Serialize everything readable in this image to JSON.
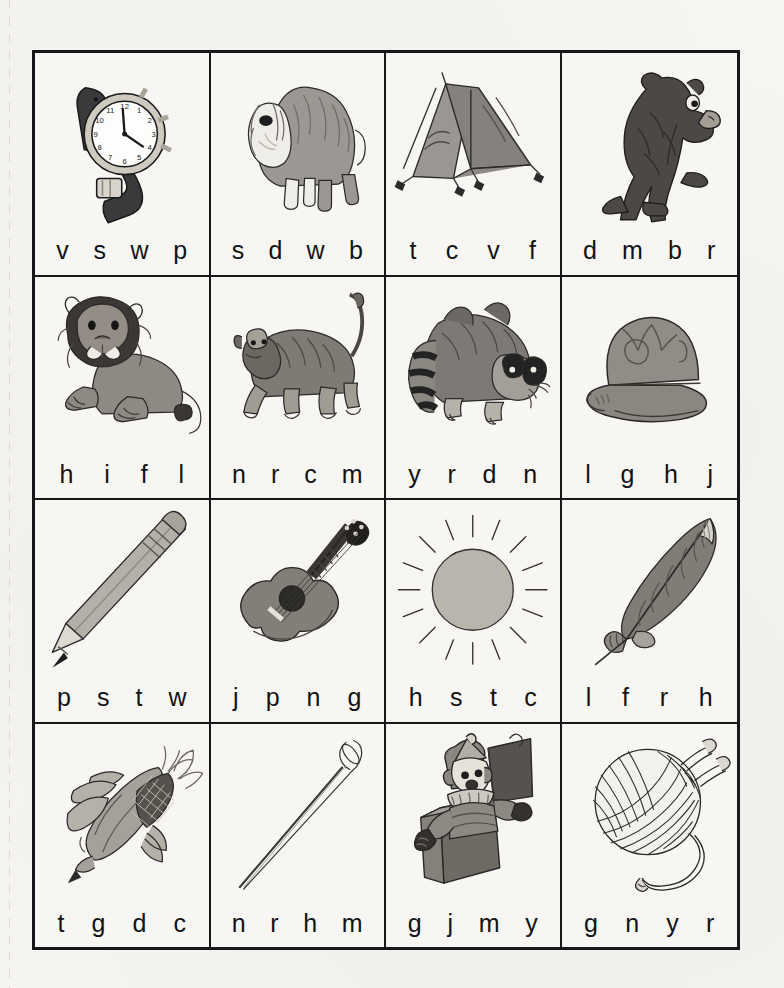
{
  "worksheet": {
    "title": "Beginning Sounds Picture Grid",
    "grid": {
      "rows": 4,
      "columns": 4
    },
    "ink_color": "#16181a",
    "paper_color": "#f7f6f3"
  },
  "cells": [
    {
      "id": "cell-watch",
      "picture": "watch",
      "picture_icon": "wristwatch-icon",
      "letters": [
        "v",
        "s",
        "w",
        "p"
      ],
      "answer": "w"
    },
    {
      "id": "cell-dog",
      "picture": "sheepdog",
      "picture_icon": "dog-icon",
      "letters": [
        "s",
        "d",
        "w",
        "b"
      ],
      "answer": "d"
    },
    {
      "id": "cell-tent",
      "picture": "tent",
      "picture_icon": "tent-icon",
      "letters": [
        "t",
        "c",
        "v",
        "f"
      ],
      "answer": "t"
    },
    {
      "id": "cell-bear",
      "picture": "bear",
      "picture_icon": "bear-icon",
      "letters": [
        "d",
        "m",
        "b",
        "r"
      ],
      "answer": "b"
    },
    {
      "id": "cell-lion",
      "picture": "lion",
      "picture_icon": "lion-icon",
      "letters": [
        "h",
        "i",
        "f",
        "l"
      ],
      "answer": "l"
    },
    {
      "id": "cell-monkey",
      "picture": "monkey",
      "picture_icon": "monkey-icon",
      "letters": [
        "n",
        "r",
        "c",
        "m"
      ],
      "answer": "m"
    },
    {
      "id": "cell-raccoon",
      "picture": "raccoon",
      "picture_icon": "raccoon-icon",
      "letters": [
        "y",
        "r",
        "d",
        "n"
      ],
      "answer": "r"
    },
    {
      "id": "cell-hat",
      "picture": "hat",
      "picture_icon": "hat-icon",
      "letters": [
        "l",
        "g",
        "h",
        "j"
      ],
      "answer": "h"
    },
    {
      "id": "cell-pencil",
      "picture": "pencil",
      "picture_icon": "pencil-icon",
      "letters": [
        "p",
        "s",
        "t",
        "w"
      ],
      "answer": "p"
    },
    {
      "id": "cell-guitar",
      "picture": "guitar",
      "picture_icon": "guitar-icon",
      "letters": [
        "j",
        "p",
        "n",
        "g"
      ],
      "answer": "g"
    },
    {
      "id": "cell-sun",
      "picture": "sun",
      "picture_icon": "sun-icon",
      "letters": [
        "h",
        "s",
        "t",
        "c"
      ],
      "answer": "s"
    },
    {
      "id": "cell-feather",
      "picture": "feather",
      "picture_icon": "feather-icon",
      "letters": [
        "l",
        "f",
        "r",
        "h"
      ],
      "answer": "f"
    },
    {
      "id": "cell-corn",
      "picture": "corn",
      "picture_icon": "corn-icon",
      "letters": [
        "t",
        "g",
        "d",
        "c"
      ],
      "answer": "c"
    },
    {
      "id": "cell-needle",
      "picture": "needle",
      "picture_icon": "needle-icon",
      "letters": [
        "n",
        "r",
        "h",
        "m"
      ],
      "answer": "n"
    },
    {
      "id": "cell-jackbox",
      "picture": "jack-in-the-box",
      "picture_icon": "jack-in-the-box-icon",
      "letters": [
        "g",
        "j",
        "m",
        "y"
      ],
      "answer": "j"
    },
    {
      "id": "cell-yarn",
      "picture": "ball of yarn",
      "picture_icon": "yarn-ball-icon",
      "letters": [
        "g",
        "n",
        "y",
        "r"
      ],
      "answer": "y"
    }
  ],
  "watch_face": {
    "numerals": [
      "12",
      "1",
      "2",
      "3",
      "4",
      "5",
      "6",
      "7",
      "8",
      "9",
      "10",
      "11"
    ]
  }
}
